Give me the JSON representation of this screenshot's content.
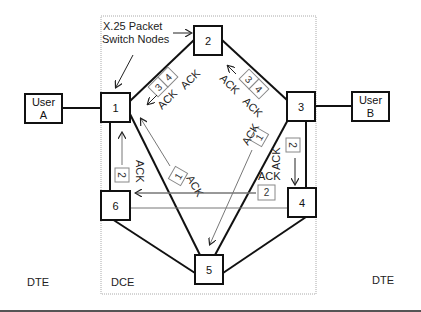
{
  "diagram": {
    "title_annotation": [
      "X.25 Packet",
      "Switch Nodes"
    ],
    "region_labels": {
      "dte_left": "DTE",
      "dce": "DCE",
      "dte_right": "DTE"
    },
    "users": [
      {
        "id": "A",
        "line1": "User",
        "line2": "A"
      },
      {
        "id": "B",
        "line1": "User",
        "line2": "B"
      }
    ],
    "nodes": [
      {
        "id": "1",
        "label": "1"
      },
      {
        "id": "2",
        "label": "2"
      },
      {
        "id": "3",
        "label": "3"
      },
      {
        "id": "4",
        "label": "4"
      },
      {
        "id": "5",
        "label": "5"
      },
      {
        "id": "6",
        "label": "6"
      }
    ],
    "links": [
      [
        "User A",
        "1"
      ],
      [
        "1",
        "2"
      ],
      [
        "2",
        "3"
      ],
      [
        "3",
        "User B"
      ],
      [
        "1",
        "6"
      ],
      [
        "1",
        "5"
      ],
      [
        "3",
        "5"
      ],
      [
        "3",
        "4"
      ],
      [
        "6",
        "5"
      ],
      [
        "4",
        "5"
      ]
    ],
    "packets": {
      "p3_left": "3",
      "p4_left": "4",
      "p3_right": "3",
      "p4_right": "4",
      "p1_mid_left": "1",
      "p1_mid_right": "1",
      "p2_left": "2",
      "p2_right_vert": "2",
      "p2_horiz": "2"
    },
    "ack": "ACK",
    "colors": {
      "line": "#111111",
      "packet_border": "#888888",
      "boundary": "#aaaaaa",
      "thin_arrow": "#777777"
    }
  }
}
